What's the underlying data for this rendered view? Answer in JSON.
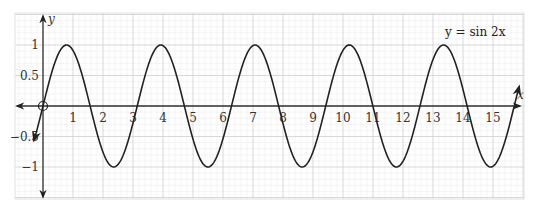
{
  "chart_data": {
    "type": "line",
    "title": "",
    "annotation": "y = sin 2x",
    "xlabel": "x",
    "ylabel": "y",
    "xlim": [
      -0.9,
      16.0
    ],
    "ylim": [
      -1.5,
      1.55
    ],
    "x_ticks": [
      1,
      2,
      3,
      4,
      5,
      6,
      7,
      8,
      9,
      10,
      11,
      12,
      13,
      14,
      15
    ],
    "x_tick_labels": [
      "1",
      "2",
      "3",
      "4",
      "5",
      "6",
      "7",
      "8",
      "9",
      "10",
      "11",
      "12",
      "13",
      "14",
      "15"
    ],
    "y_ticks": [
      1,
      0.5,
      -0.5,
      -1
    ],
    "y_tick_labels": [
      "1",
      "0.5",
      "−0.5",
      "−1"
    ],
    "grid": true,
    "grid_minor_step_x": 0.2,
    "grid_minor_step_y": 0.1,
    "series": [
      {
        "name": "y = sin 2x",
        "function": "sin(2x)",
        "x_start": -0.3,
        "x_end": 15.87,
        "arrow_start": true,
        "arrow_end": true,
        "open_circle_at": [
          0,
          0
        ],
        "peaks_x": [
          0.785,
          3.927,
          7.069,
          10.21,
          13.352
        ],
        "troughs_x": [
          2.356,
          5.498,
          8.639,
          11.781,
          14.923
        ],
        "amplitude": 1,
        "period": 3.1416
      }
    ],
    "colors": {
      "curve": "#222222",
      "axis": "#333333",
      "grid_major": "#cfcfcf",
      "grid_minor": "#ececec",
      "background": "#ffffff"
    }
  },
  "labels": {
    "equation": "y = sin 2x",
    "x_axis": "x",
    "y_axis": "y"
  }
}
